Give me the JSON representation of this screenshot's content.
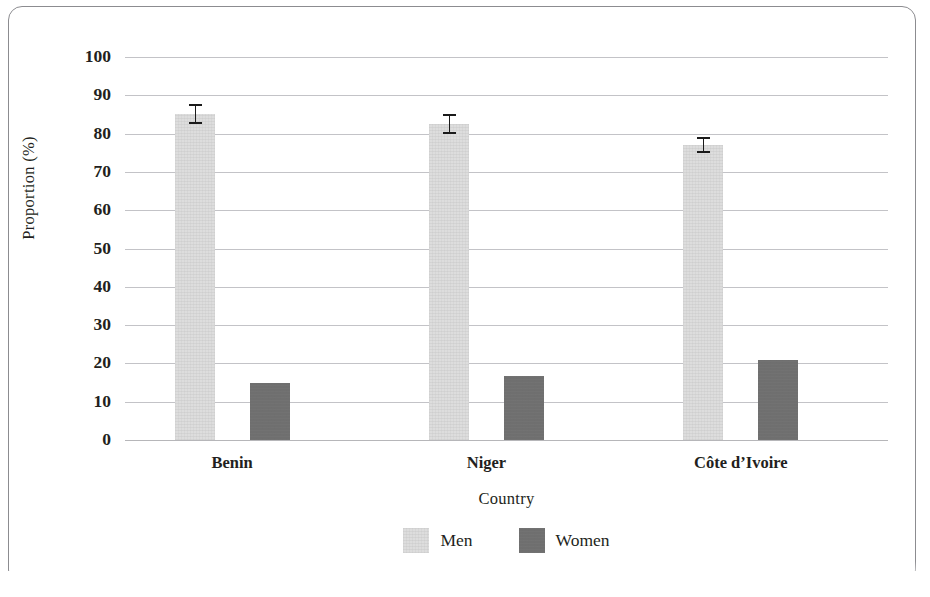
{
  "chart_data": {
    "type": "bar",
    "title": "",
    "xlabel": "Country",
    "ylabel": "Proportion (%)",
    "categories": [
      "Benin",
      "Niger",
      "Côte d’Ivoire"
    ],
    "series": [
      {
        "name": "Men",
        "color": "#dddddd",
        "values": [
          85,
          82.5,
          77
        ],
        "errors": [
          2.6,
          2.7,
          2.0
        ]
      },
      {
        "name": "Women",
        "color": "#6f6f6f",
        "values": [
          15,
          16.7,
          21
        ],
        "errors": [
          0,
          0,
          0
        ]
      }
    ],
    "ylim": [
      0,
      100
    ],
    "yticks": [
      "0",
      "10",
      "20",
      "30",
      "40",
      "50",
      "60",
      "70",
      "80",
      "90",
      "100"
    ],
    "ytick_values": [
      0,
      10,
      20,
      30,
      40,
      50,
      60,
      70,
      80,
      90,
      100
    ],
    "grid": true,
    "legend_position": "bottom",
    "error_bars": true
  },
  "axes": {
    "y_title": "Proportion (%)",
    "x_title": "Country"
  },
  "legend": {
    "items": [
      {
        "label": "Men",
        "color": "#dddddd"
      },
      {
        "label": "Women",
        "color": "#6f6f6f"
      }
    ]
  },
  "colors": {
    "men": "#dddddd",
    "women": "#6f6f6f",
    "gridline": "#b9b9bd",
    "text": "#231f20",
    "frame": "#8c8c90"
  }
}
